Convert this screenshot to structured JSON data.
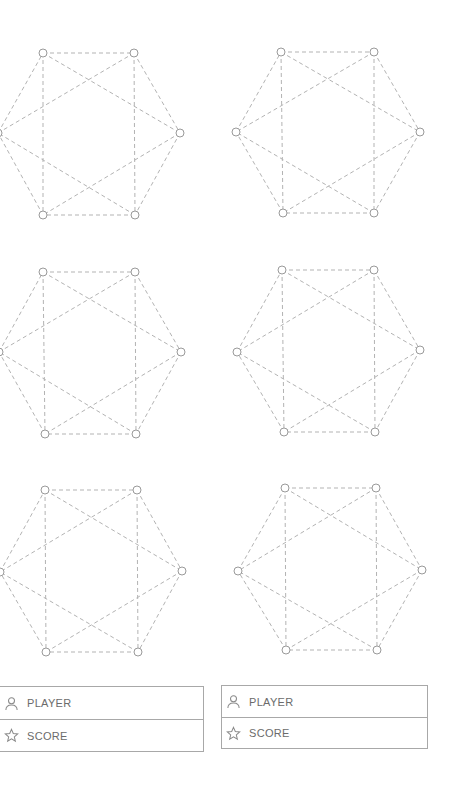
{
  "game": {
    "boards": [
      {
        "name": "board-1"
      },
      {
        "name": "board-2"
      },
      {
        "name": "board-3"
      },
      {
        "name": "board-4"
      },
      {
        "name": "board-5"
      },
      {
        "name": "board-6"
      }
    ],
    "vertex_count": 6,
    "edges": [
      [
        0,
        1
      ],
      [
        1,
        2
      ],
      [
        2,
        3
      ],
      [
        3,
        4
      ],
      [
        4,
        5
      ],
      [
        5,
        0
      ],
      [
        0,
        4
      ],
      [
        1,
        3
      ],
      [
        0,
        2
      ],
      [
        1,
        5
      ],
      [
        3,
        5
      ],
      [
        2,
        4
      ]
    ]
  },
  "players": [
    {
      "player_label": "PLAYER",
      "score_label": "SCORE",
      "player_icon": "user-icon",
      "score_icon": "star-icon"
    },
    {
      "player_label": "PLAYER",
      "score_label": "SCORE",
      "player_icon": "user-icon",
      "score_icon": "star-icon"
    }
  ],
  "colors": {
    "edge": "#b3b3b3",
    "vertex": "#9a9a9a",
    "text": "#6b6b6b",
    "border": "#a8a8a8"
  }
}
